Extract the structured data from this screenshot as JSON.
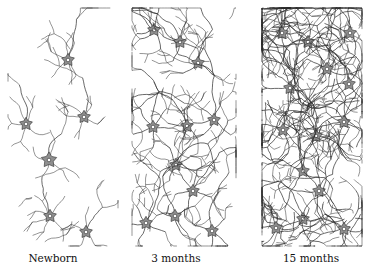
{
  "figure": {
    "panels": [
      {
        "label": "Newborn",
        "density": "sparse",
        "branch_depth": 2,
        "neurons": [
          [
            68,
            60
          ],
          [
            26,
            124
          ],
          [
            84,
            117
          ],
          [
            49,
            160
          ],
          [
            50,
            216
          ],
          [
            86,
            232
          ]
        ],
        "extra_fibers": 4
      },
      {
        "label": "3 months",
        "density": "medium",
        "branch_depth": 3,
        "neurons": [
          [
            154,
            30
          ],
          [
            180,
            42
          ],
          [
            198,
            63
          ],
          [
            153,
            127
          ],
          [
            187,
            126
          ],
          [
            214,
            120
          ],
          [
            176,
            165
          ],
          [
            193,
            191
          ],
          [
            175,
            216
          ],
          [
            146,
            223
          ],
          [
            212,
            231
          ]
        ],
        "extra_fibers": 14
      },
      {
        "label": "15 months",
        "density": "dense",
        "branch_depth": 4,
        "neurons": [
          [
            282,
            33
          ],
          [
            308,
            42
          ],
          [
            350,
            33
          ],
          [
            327,
            69
          ],
          [
            349,
            84
          ],
          [
            290,
            88
          ],
          [
            344,
            122
          ],
          [
            283,
            130
          ],
          [
            316,
            136
          ],
          [
            303,
            171
          ],
          [
            319,
            191
          ],
          [
            303,
            219
          ],
          [
            276,
            228
          ],
          [
            344,
            229
          ]
        ],
        "extra_fibers": 70
      }
    ],
    "colors": {
      "soma_fill": "#8f8f8f",
      "line": "#2a2a2a",
      "nucleus": "#ffffff"
    }
  }
}
